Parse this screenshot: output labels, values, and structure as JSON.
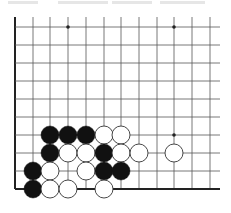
{
  "diagram": {
    "type": "go-board-fragment",
    "corner": "bottom-left",
    "columns_x": [
      15,
      33,
      50,
      68,
      86,
      104,
      121,
      139,
      157,
      174,
      192,
      210
    ],
    "rows_y": [
      27,
      45,
      63,
      81,
      99,
      117,
      135,
      153,
      171,
      189
    ],
    "grid_top": 17,
    "grid_right": 220,
    "left_edge_x": 15,
    "bottom_edge_y": 189,
    "star_points": [
      {
        "x": 68,
        "y": 27
      },
      {
        "x": 174,
        "y": 27
      },
      {
        "x": 174,
        "y": 135
      }
    ],
    "stone_radius": 9,
    "stones": [
      {
        "color": "black",
        "x": 50,
        "y": 135
      },
      {
        "color": "black",
        "x": 68,
        "y": 135
      },
      {
        "color": "black",
        "x": 86,
        "y": 135
      },
      {
        "color": "white",
        "x": 104,
        "y": 135
      },
      {
        "color": "white",
        "x": 121,
        "y": 135
      },
      {
        "color": "black",
        "x": 50,
        "y": 153
      },
      {
        "color": "white",
        "x": 68,
        "y": 153
      },
      {
        "color": "white",
        "x": 86,
        "y": 153
      },
      {
        "color": "black",
        "x": 104,
        "y": 153
      },
      {
        "color": "white",
        "x": 121,
        "y": 153
      },
      {
        "color": "white",
        "x": 139,
        "y": 153
      },
      {
        "color": "white",
        "x": 174,
        "y": 153
      },
      {
        "color": "black",
        "x": 33,
        "y": 171
      },
      {
        "color": "white",
        "x": 50,
        "y": 171
      },
      {
        "color": "white",
        "x": 86,
        "y": 171
      },
      {
        "color": "black",
        "x": 104,
        "y": 171
      },
      {
        "color": "black",
        "x": 121,
        "y": 171
      },
      {
        "color": "black",
        "x": 33,
        "y": 189
      },
      {
        "color": "white",
        "x": 50,
        "y": 189
      },
      {
        "color": "white",
        "x": 68,
        "y": 189
      },
      {
        "color": "white",
        "x": 104,
        "y": 189
      }
    ],
    "colors": {
      "line": "#555555",
      "edge": "#222222",
      "black_stone": "#111111",
      "white_stone": "#ffffff",
      "white_stone_outline": "#333333",
      "background": "#ffffff"
    }
  }
}
